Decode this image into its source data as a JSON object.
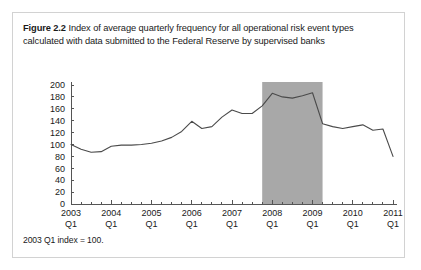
{
  "figure": {
    "label": "Figure 2.2",
    "caption": "Index of average quarterly frequency for all operational risk event types calculated with data submitted to the Federal Reserve by supervised banks",
    "footnote": "2003 Q1 index = 100."
  },
  "colors": {
    "line": "#4a4a4a",
    "shaded_band": "#a8a8a8",
    "axis": "#555555",
    "border": "#d2d2d2",
    "text": "#1a1a1a",
    "background": "#ffffff"
  },
  "chart_data": {
    "type": "line",
    "title": "Index of average quarterly frequency for all operational risk event types calculated with data submitted to the Federal Reserve by supervised banks",
    "xlabel": "",
    "ylabel": "",
    "ylim": [
      0,
      200
    ],
    "ytick_step": 20,
    "yticks": [
      0,
      20,
      40,
      60,
      80,
      100,
      120,
      140,
      160,
      180,
      200
    ],
    "grid": false,
    "legend": "none",
    "x_tick_labels": [
      "2003\nQ1",
      "2004\nQ1",
      "2005\nQ1",
      "2006\nQ1",
      "2007\nQ1",
      "2008\nQ1",
      "2009\nQ1",
      "2010\nQ1",
      "2011\nQ1"
    ],
    "x_tick_years": [
      "2003",
      "2004",
      "2005",
      "2006",
      "2007",
      "2008",
      "2009",
      "2010",
      "2011"
    ],
    "x_tick_quarter": "Q1",
    "x_minor_per_year": 4,
    "x": [
      "2003 Q1",
      "2003 Q2",
      "2003 Q3",
      "2003 Q4",
      "2004 Q1",
      "2004 Q2",
      "2004 Q3",
      "2004 Q4",
      "2005 Q1",
      "2005 Q2",
      "2005 Q3",
      "2005 Q4",
      "2006 Q1",
      "2006 Q2",
      "2006 Q3",
      "2006 Q4",
      "2007 Q1",
      "2007 Q2",
      "2007 Q3",
      "2007 Q4",
      "2008 Q1",
      "2008 Q2",
      "2008 Q3",
      "2008 Q4",
      "2009 Q1",
      "2009 Q2",
      "2009 Q3",
      "2009 Q4",
      "2010 Q1",
      "2010 Q2",
      "2010 Q3",
      "2010 Q4",
      "2011 Q1"
    ],
    "values": [
      100,
      92,
      87,
      88,
      97,
      99,
      99,
      100,
      102,
      106,
      112,
      122,
      139,
      127,
      130,
      146,
      158,
      152,
      152,
      165,
      186,
      180,
      178,
      182,
      187,
      135,
      130,
      127,
      130,
      133,
      124,
      126,
      80
    ],
    "annotations": [
      {
        "type": "shaded_band",
        "label": "recession band",
        "x_start": "2007 Q4",
        "x_end": "2009 Q2",
        "color": "#a8a8a8"
      }
    ]
  }
}
